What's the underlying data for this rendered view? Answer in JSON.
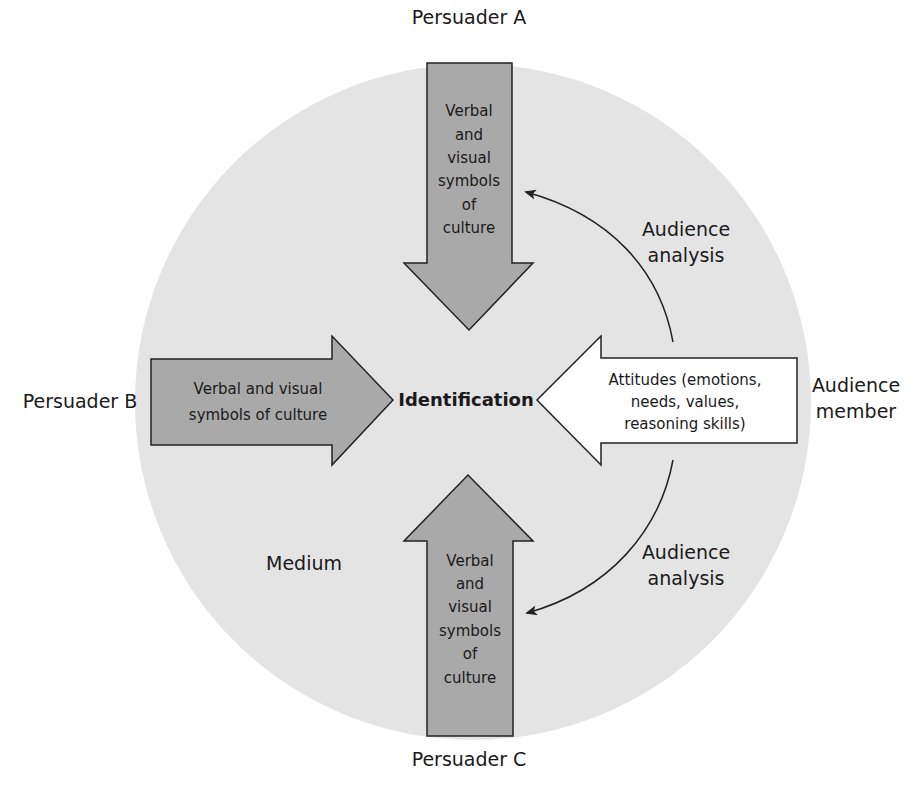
{
  "diagram": {
    "type": "persuasion-identification-model",
    "colors": {
      "background": "#ffffff",
      "circle_fill": "#e4e4e4",
      "persuader_arrow_fill": "#a9a9a9",
      "audience_arrow_fill": "#ffffff",
      "stroke": "#222222",
      "text": "#1a1a1a"
    },
    "center_label": "Identification",
    "medium_label": "Medium",
    "persuaders": {
      "a": {
        "label": "Persuader A",
        "arrow_text": [
          "Verbal",
          "and",
          "visual",
          "symbols",
          "of",
          "culture"
        ],
        "direction": "down"
      },
      "b": {
        "label": "Persuader B",
        "arrow_text": [
          "Verbal and visual",
          "symbols of culture"
        ],
        "direction": "right"
      },
      "c": {
        "label": "Persuader C",
        "arrow_text": [
          "Verbal",
          "and",
          "visual",
          "symbols",
          "of",
          "culture"
        ],
        "direction": "up"
      }
    },
    "audience": {
      "label": [
        "Audience",
        "member"
      ],
      "arrow_text": [
        "Attitudes (emotions,",
        "needs, values,",
        "reasoning skills)"
      ],
      "direction": "left"
    },
    "feedback_arrows": [
      {
        "label": [
          "Audience",
          "analysis"
        ],
        "from": "audience",
        "to": "persuader-a"
      },
      {
        "label": [
          "Audience",
          "analysis"
        ],
        "from": "audience",
        "to": "persuader-c"
      }
    ]
  }
}
